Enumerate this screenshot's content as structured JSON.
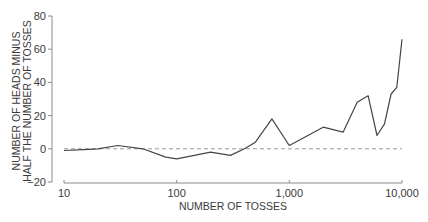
{
  "chart_data": {
    "type": "line",
    "title": "",
    "xlabel": "NUMBER OF TOSSES",
    "ylabel_lines": [
      "NUMBER OF HEADS MINUS",
      "HALF THE NUMBER OF TOSSES"
    ],
    "ylabel": "NUMBER OF HEADS MINUS HALF THE NUMBER OF TOSSES",
    "x_scale": "log",
    "xlim": [
      10,
      10000
    ],
    "ylim": [
      -20,
      80
    ],
    "x_ticks": [
      10,
      100,
      1000,
      10000
    ],
    "x_tick_labels": [
      "10",
      "100",
      "1,000",
      "10,000"
    ],
    "y_ticks": [
      -20,
      0,
      20,
      40,
      60,
      80
    ],
    "y_tick_labels": [
      "−20",
      "0",
      "20",
      "40",
      "60",
      "80"
    ],
    "grid": false,
    "legend": null,
    "reference_line": {
      "y": 0,
      "style": "dashed"
    },
    "series": [
      {
        "name": "heads minus half tosses",
        "x": [
          10,
          15,
          20,
          30,
          50,
          80,
          100,
          200,
          300,
          400,
          500,
          700,
          1000,
          2000,
          3000,
          4000,
          5000,
          6000,
          7000,
          8000,
          9000,
          10000
        ],
        "values": [
          -1,
          -0.5,
          0,
          2,
          0,
          -5,
          -6,
          -2,
          -4,
          0,
          4,
          18,
          2,
          13,
          10,
          28,
          32,
          8,
          15,
          33,
          37,
          66
        ]
      }
    ]
  },
  "colors": {
    "data_line": "#454545",
    "axis": "#8a8a8a",
    "reference_line": "#9a9a9a",
    "text": "#3a3a3a"
  }
}
